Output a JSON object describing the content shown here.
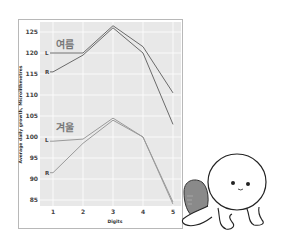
{
  "chart_data": {
    "type": "line",
    "title": "",
    "xlabel": "Digits",
    "ylabel": "Average daily growth, Microlithmetres",
    "x": [
      1,
      2,
      3,
      4,
      5
    ],
    "x_tick_labels": [
      "1",
      "2",
      "3",
      "4",
      "5"
    ],
    "y_tick_labels": [
      "125",
      "120",
      "115",
      "110",
      "105",
      "100",
      "95",
      "90",
      "85"
    ],
    "ylim": [
      84,
      127
    ],
    "grid": true,
    "groups": [
      {
        "name": "여름",
        "series": [
          {
            "name": "L",
            "values": [
              120,
              120,
              126.5,
              121.5,
              110.5
            ]
          },
          {
            "name": "R",
            "values": [
              115.5,
              119.5,
              126,
              120,
              103
            ]
          }
        ]
      },
      {
        "name": "겨울",
        "series": [
          {
            "name": "L",
            "values": [
              99,
              99.5,
              104.5,
              100,
              84.5
            ]
          },
          {
            "name": "R",
            "values": [
              91.5,
              98.5,
              104,
              100,
              84
            ]
          }
        ]
      }
    ],
    "colors": {
      "summer": "#6a6a6a",
      "winter": "#9a9a9a",
      "plot_bg": "#e8e8e8",
      "grid": "#ffffff"
    }
  },
  "labels": {
    "summer": "여름",
    "winter": "겨울",
    "L": "L",
    "R": "R"
  },
  "mascot": "round-white-character-holding-gray-blob"
}
